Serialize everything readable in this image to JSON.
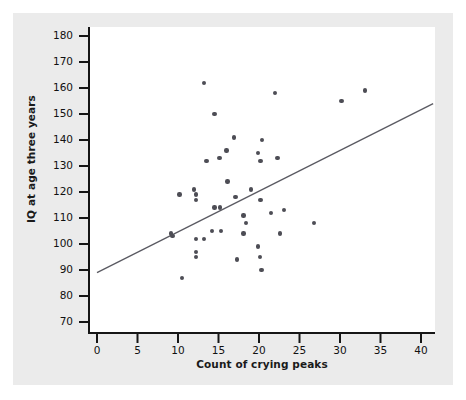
{
  "chart_data": {
    "type": "scatter",
    "title": "",
    "xlabel": "Count of crying peaks",
    "ylabel": "IQ at age three years",
    "xlim": [
      0,
      41.5
    ],
    "ylim": [
      66,
      182
    ],
    "xticks": [
      0,
      5,
      10,
      15,
      20,
      25,
      30,
      35,
      40
    ],
    "xtick_labels": [
      "0",
      "5",
      "10",
      "15",
      "20",
      "25",
      "30",
      "35",
      "40"
    ],
    "yticks": [
      70,
      80,
      90,
      100,
      110,
      120,
      130,
      140,
      150,
      160,
      170,
      180
    ],
    "ytick_labels": [
      "70",
      "80",
      "90",
      "100",
      "110",
      "120",
      "130",
      "140",
      "150",
      "160",
      "170",
      "180"
    ],
    "grid": false,
    "legend": "none",
    "marker_color": "#4d4d55",
    "line_color": "#5a5a62",
    "plot_background": "#ffffff",
    "figure_background": "#ebebeb",
    "points": [
      [
        13.2,
        162
      ],
      [
        14.5,
        150
      ],
      [
        22.0,
        158
      ],
      [
        30.2,
        155
      ],
      [
        33.1,
        159
      ],
      [
        16.9,
        141
      ],
      [
        16.0,
        136
      ],
      [
        15.1,
        133
      ],
      [
        20.4,
        140
      ],
      [
        19.9,
        135
      ],
      [
        13.5,
        132
      ],
      [
        20.2,
        132
      ],
      [
        22.3,
        133
      ],
      [
        10.2,
        119
      ],
      [
        12.2,
        119
      ],
      [
        12.2,
        117
      ],
      [
        12.0,
        121
      ],
      [
        14.5,
        114
      ],
      [
        15.2,
        114
      ],
      [
        16.1,
        124
      ],
      [
        17.1,
        118
      ],
      [
        19.0,
        121
      ],
      [
        20.2,
        117
      ],
      [
        21.5,
        112
      ],
      [
        23.1,
        113
      ],
      [
        26.8,
        108
      ],
      [
        18.1,
        111
      ],
      [
        18.4,
        108
      ],
      [
        9.1,
        104
      ],
      [
        9.3,
        103
      ],
      [
        12.2,
        102
      ],
      [
        13.2,
        102
      ],
      [
        14.2,
        105
      ],
      [
        15.3,
        105
      ],
      [
        18.1,
        104
      ],
      [
        22.6,
        104
      ],
      [
        12.2,
        97
      ],
      [
        12.2,
        95
      ],
      [
        19.9,
        99
      ],
      [
        20.1,
        95
      ],
      [
        17.3,
        94
      ],
      [
        10.5,
        87
      ],
      [
        20.3,
        90
      ]
    ],
    "trend_line": {
      "x_start": 0,
      "y_start": 89,
      "x_end": 41.5,
      "y_end": 154
    }
  }
}
